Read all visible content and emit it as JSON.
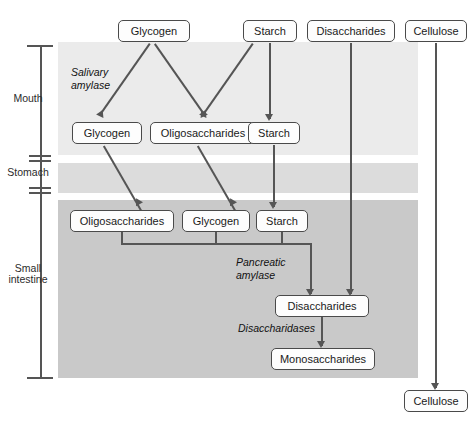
{
  "diagram": {
    "regions": [
      {
        "name": "mouth",
        "label": "Mouth",
        "shade": "#ebebeb"
      },
      {
        "name": "stomach",
        "label": "Stomach",
        "shade": "#dcdcdc"
      },
      {
        "name": "intestine",
        "label": "Small\nintestine",
        "shade": "#c9c9c9"
      }
    ],
    "region_labels": {
      "mouth": "Mouth",
      "stomach": "Stomach",
      "small_intestine_line1": "Small",
      "small_intestine_line2": "intestine"
    },
    "nodes": {
      "input_glycogen": "Glycogen",
      "input_starch": "Starch",
      "input_disaccharides": "Disaccharides",
      "input_cellulose": "Cellulose",
      "mouth_glycogen": "Glycogen",
      "mouth_oligosaccharides": "Oligosaccharides",
      "mouth_starch": "Starch",
      "intestine_oligosaccharides": "Oligosaccharides",
      "intestine_glycogen": "Glycogen",
      "intestine_starch": "Starch",
      "disaccharides": "Disaccharides",
      "monosaccharides": "Monosaccharides",
      "output_cellulose": "Cellulose"
    },
    "enzymes": {
      "salivary_amylase": "Salivary\namylase",
      "pancreatic_amylase": "Pancreatic\namylase",
      "disaccharidases": "Disaccharidases"
    },
    "colors": {
      "line": "#555555",
      "box_border": "#4a4a4a",
      "box_fill": "#fdfdfd",
      "background": "#ffffff"
    }
  }
}
